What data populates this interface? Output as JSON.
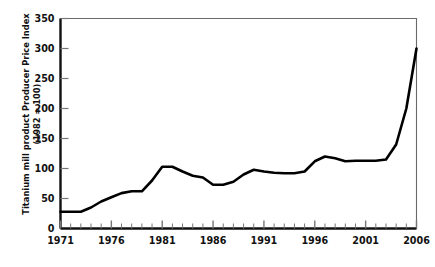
{
  "chart_data": {
    "type": "line",
    "title": "",
    "xlabel": "",
    "ylabel": "Titanium mill product Producer Price Index (1982 = 100)",
    "ylabel_line1": "Titanium mill product Producer Price Index",
    "ylabel_line2": "(1982 = 100)",
    "ylim": [
      0,
      350
    ],
    "xlim": [
      1971,
      2006
    ],
    "ytick_labels": [
      "0",
      "50",
      "100",
      "150",
      "200",
      "250",
      "300",
      "350"
    ],
    "ytick_values": [
      0,
      50,
      100,
      150,
      200,
      250,
      300,
      350
    ],
    "xtick_labels": [
      "1971",
      "1976",
      "1981",
      "1986",
      "1991",
      "1996",
      "2001",
      "2006"
    ],
    "xtick_values": [
      1971,
      1976,
      1981,
      1986,
      1991,
      1996,
      2001,
      2006
    ],
    "xminor_step": 1,
    "grid": false,
    "legend": false,
    "line_color": "#000000",
    "line_width": 2.6,
    "x": [
      1971,
      1972,
      1973,
      1974,
      1975,
      1976,
      1977,
      1978,
      1979,
      1980,
      1981,
      1982,
      1983,
      1984,
      1985,
      1986,
      1987,
      1988,
      1989,
      1990,
      1991,
      1992,
      1993,
      1994,
      1995,
      1996,
      1997,
      1998,
      1999,
      2000,
      2001,
      2002,
      2003,
      2004,
      2005,
      2006
    ],
    "values": [
      28,
      28,
      28,
      35,
      45,
      52,
      59,
      62,
      62,
      80,
      103,
      103,
      95,
      88,
      85,
      73,
      73,
      78,
      90,
      98,
      95,
      93,
      92,
      92,
      95,
      112,
      120,
      117,
      112,
      113,
      113,
      113,
      115,
      140,
      200,
      300
    ],
    "series": [
      {
        "name": "Titanium mill product Producer Price Index",
        "values": [
          28,
          28,
          28,
          35,
          45,
          52,
          59,
          62,
          62,
          80,
          103,
          103,
          95,
          88,
          85,
          73,
          73,
          78,
          90,
          98,
          95,
          93,
          92,
          92,
          95,
          112,
          120,
          117,
          112,
          113,
          113,
          113,
          115,
          140,
          200,
          300
        ]
      }
    ]
  }
}
